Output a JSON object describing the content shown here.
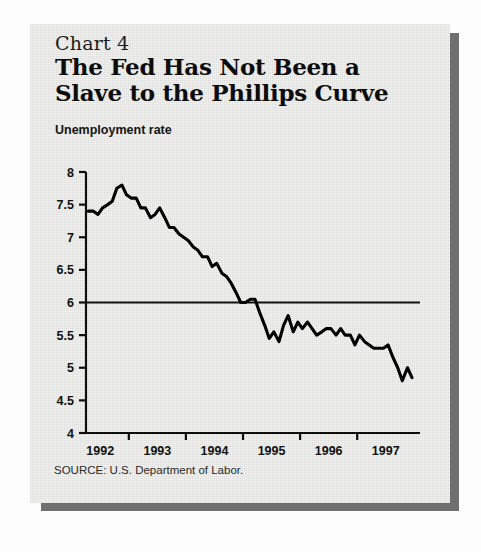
{
  "card": {
    "chart_number": "Chart 4",
    "title_line1": "The Fed Has Not Been a",
    "title_line2": "Slave to the Phillips Curve",
    "unit_label": "Unemployment rate",
    "source": "SOURCE: U.S. Department of Labor."
  },
  "chart_data": {
    "type": "line",
    "title": "The Fed Has Not Been a Slave to the Phillips Curve",
    "subtitle": "Chart 4",
    "xlabel": "",
    "ylabel": "Unemployment rate",
    "ylim": [
      4,
      8
    ],
    "xlim": [
      1991.75,
      1997.6
    ],
    "yticks": [
      4,
      4.5,
      5,
      5.5,
      6,
      6.5,
      7,
      7.5,
      8
    ],
    "ytick_labels": [
      "4",
      "4.5",
      "5",
      "5.5",
      "6",
      "6.5",
      "7",
      "7.5",
      "8"
    ],
    "xticks": [
      1992,
      1993,
      1994,
      1995,
      1996,
      1997
    ],
    "xtick_labels": [
      "1992",
      "1993",
      "1994",
      "1995",
      "1996",
      "1997"
    ],
    "grid": false,
    "legend": null,
    "reference_lines": [
      {
        "name": "natural-rate-line",
        "axis": "y",
        "value": 6,
        "label": ""
      }
    ],
    "series": [
      {
        "name": "Unemployment rate",
        "color": "#000000",
        "x": [
          1991.79,
          1991.88,
          1991.96,
          1992.04,
          1992.13,
          1992.21,
          1992.29,
          1992.38,
          1992.46,
          1992.54,
          1992.63,
          1992.71,
          1992.79,
          1992.88,
          1992.96,
          1993.04,
          1993.13,
          1993.21,
          1993.29,
          1993.38,
          1993.46,
          1993.54,
          1993.63,
          1993.71,
          1993.79,
          1993.88,
          1993.96,
          1994.04,
          1994.13,
          1994.21,
          1994.29,
          1994.38,
          1994.46,
          1994.54,
          1994.63,
          1994.71,
          1994.79,
          1994.88,
          1994.96,
          1995.04,
          1995.13,
          1995.21,
          1995.29,
          1995.38,
          1995.46,
          1995.54,
          1995.63,
          1995.71,
          1995.79,
          1995.88,
          1995.96,
          1996.04,
          1996.13,
          1996.21,
          1996.29,
          1996.38,
          1996.46,
          1996.54,
          1996.63,
          1996.71,
          1996.79,
          1996.88,
          1996.96,
          1997.04,
          1997.13,
          1997.21,
          1997.29,
          1997.38,
          1997.46
        ],
        "y": [
          7.4,
          7.4,
          7.35,
          7.45,
          7.5,
          7.55,
          7.75,
          7.8,
          7.65,
          7.6,
          7.6,
          7.45,
          7.45,
          7.3,
          7.35,
          7.45,
          7.3,
          7.15,
          7.15,
          7.05,
          7.0,
          6.95,
          6.85,
          6.8,
          6.7,
          6.7,
          6.55,
          6.6,
          6.45,
          6.4,
          6.3,
          6.15,
          6.0,
          6.0,
          6.05,
          6.05,
          5.85,
          5.65,
          5.45,
          5.55,
          5.4,
          5.65,
          5.8,
          5.55,
          5.7,
          5.6,
          5.7,
          5.6,
          5.5,
          5.55,
          5.6,
          5.6,
          5.5,
          5.6,
          5.5,
          5.5,
          5.35,
          5.5,
          5.4,
          5.35,
          5.3,
          5.3,
          5.3,
          5.35,
          5.15,
          5.0,
          4.8,
          5.0,
          4.85
        ]
      }
    ]
  }
}
